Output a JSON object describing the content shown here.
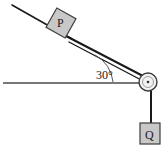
{
  "figure": {
    "width": 164,
    "height": 146,
    "background_color": "#ffffff"
  },
  "labels": {
    "incline_block": "P",
    "hanging_block": "Q",
    "angle": "30°"
  },
  "colors": {
    "block_fill": "#c8c8c8",
    "block_stroke": "#3c3c3c",
    "line_stroke": "#1a1a1a",
    "beam_stroke": "#1a1a1a",
    "ground_stroke": "#4a4a4a",
    "pulley_fill": "#f2f2f2",
    "pulley_stroke": "#3c3c3c",
    "arc_stroke": "#555555",
    "text_color": "#1a1a1a"
  },
  "geometry": {
    "incline_angle_degrees": 30,
    "incline_top": {
      "x": 12,
      "y": 5
    },
    "pulley_center": {
      "x": 148,
      "y": 82
    },
    "pulley_radius": 9,
    "ground_line": {
      "x1": 3,
      "y1": 83,
      "x2": 141,
      "y2": 83
    },
    "block_p_center": {
      "x": 61,
      "y": 23
    },
    "block_p_size": 22,
    "block_q_center": {
      "x": 150,
      "y": 133
    },
    "block_q_size": 20,
    "string_vertical": {
      "x": 151,
      "y1": 88,
      "y2": 123
    }
  }
}
